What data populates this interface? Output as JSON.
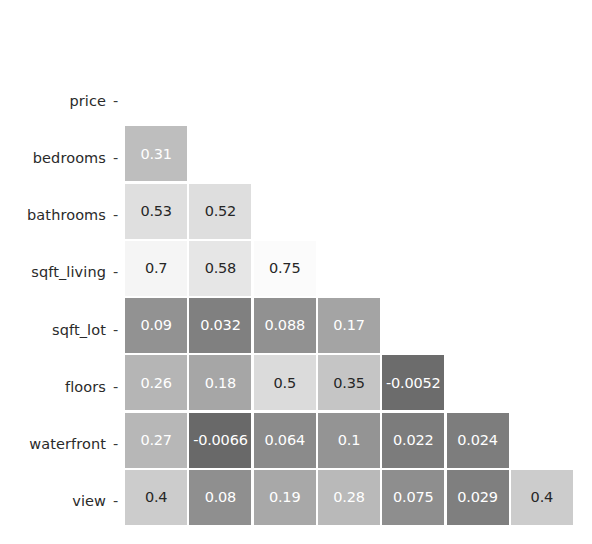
{
  "chart_data": {
    "type": "heatmap",
    "title": "",
    "subtitle": "",
    "xlabel": "",
    "ylabel": "",
    "colormap": "grayscale",
    "grid": false,
    "legend": "none",
    "annotated": true,
    "mask": "lower-triangle",
    "row_labels": [
      "price",
      "bedrooms",
      "bathrooms",
      "sqft_living",
      "sqft_lot",
      "floors",
      "waterfront",
      "view"
    ],
    "col_labels": [
      "price",
      "bedrooms",
      "bathrooms",
      "sqft_living",
      "sqft_lot",
      "floors",
      "waterfront"
    ],
    "rows": [
      {
        "label": "price",
        "cells": []
      },
      {
        "label": "bedrooms",
        "cells": [
          {
            "col": "price",
            "text": "0.31",
            "value": 0.31
          }
        ]
      },
      {
        "label": "bathrooms",
        "cells": [
          {
            "col": "price",
            "text": "0.53",
            "value": 0.53
          },
          {
            "col": "bedrooms",
            "text": "0.52",
            "value": 0.52
          }
        ]
      },
      {
        "label": "sqft_living",
        "cells": [
          {
            "col": "price",
            "text": "0.7",
            "value": 0.7
          },
          {
            "col": "bedrooms",
            "text": "0.58",
            "value": 0.58
          },
          {
            "col": "bathrooms",
            "text": "0.75",
            "value": 0.75
          }
        ]
      },
      {
        "label": "sqft_lot",
        "cells": [
          {
            "col": "price",
            "text": "0.09",
            "value": 0.09
          },
          {
            "col": "bedrooms",
            "text": "0.032",
            "value": 0.032
          },
          {
            "col": "bathrooms",
            "text": "0.088",
            "value": 0.088
          },
          {
            "col": "sqft_living",
            "text": "0.17",
            "value": 0.17
          }
        ]
      },
      {
        "label": "floors",
        "cells": [
          {
            "col": "price",
            "text": "0.26",
            "value": 0.26
          },
          {
            "col": "bedrooms",
            "text": "0.18",
            "value": 0.18
          },
          {
            "col": "bathrooms",
            "text": "0.5",
            "value": 0.5
          },
          {
            "col": "sqft_living",
            "text": "0.35",
            "value": 0.35
          },
          {
            "col": "sqft_lot",
            "text": "-0.0052",
            "value": -0.0052
          }
        ]
      },
      {
        "label": "waterfront",
        "cells": [
          {
            "col": "price",
            "text": "0.27",
            "value": 0.27
          },
          {
            "col": "bedrooms",
            "text": "-0.0066",
            "value": -0.0066
          },
          {
            "col": "bathrooms",
            "text": "0.064",
            "value": 0.064
          },
          {
            "col": "sqft_living",
            "text": "0.1",
            "value": 0.1
          },
          {
            "col": "sqft_lot",
            "text": "0.022",
            "value": 0.022
          },
          {
            "col": "floors",
            "text": "0.024",
            "value": 0.024
          }
        ]
      },
      {
        "label": "view",
        "cells": [
          {
            "col": "price",
            "text": "0.4",
            "value": 0.4
          },
          {
            "col": "bedrooms",
            "text": "0.08",
            "value": 0.08
          },
          {
            "col": "bathrooms",
            "text": "0.19",
            "value": 0.19
          },
          {
            "col": "sqft_living",
            "text": "0.28",
            "value": 0.28
          },
          {
            "col": "sqft_lot",
            "text": "0.075",
            "value": 0.075
          },
          {
            "col": "floors",
            "text": "0.029",
            "value": 0.029
          },
          {
            "col": "waterfront",
            "text": "0.4",
            "value": 0.4
          }
        ]
      }
    ],
    "vmin": -0.0066,
    "vmax": 0.75,
    "colors": {
      "background": "#ffffff",
      "text_dark": "#262626",
      "text_light": "#ffffff",
      "cell_gap": "#ffffff"
    }
  }
}
